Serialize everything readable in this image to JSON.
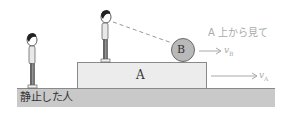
{
  "diagram": {
    "ground": {
      "label": "静止した人"
    },
    "block": {
      "label": "A"
    },
    "ball": {
      "label": "B"
    },
    "caption": "A 上から見て",
    "velocities": [
      {
        "name": "v",
        "subscript": "B",
        "attached_to": "B"
      },
      {
        "name": "v",
        "subscript": "A",
        "attached_to": "A"
      }
    ],
    "people": [
      {
        "role": "stationary-person",
        "position": "ground"
      },
      {
        "role": "observer-on-A",
        "position": "on block A",
        "looking_at": "B"
      }
    ],
    "colors": {
      "ground": "#c9c9c9",
      "block": "#ececec",
      "ball": "#b9b9b9",
      "arrow": "#aaaaaa",
      "outline": "#8a8a8a"
    }
  }
}
